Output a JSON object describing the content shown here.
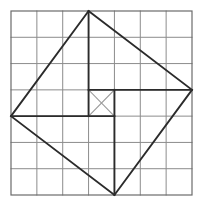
{
  "figure": {
    "background_color": "#ffffff",
    "canvas": {
      "width": 201,
      "height": 207
    },
    "grid": {
      "label": "square grid",
      "columns": 7,
      "rows": 7,
      "x_start": 11,
      "y_start": 11,
      "x_end": 192,
      "y_end": 195,
      "cell_width": 25.857,
      "cell_height": 26.286,
      "line_color": "#8c8c8c",
      "line_width": 1.0,
      "border_color": "#6b6b6b",
      "border_width": 1.2,
      "x_lines": [
        11,
        36.86,
        62.71,
        88.57,
        114.43,
        140.29,
        166.14,
        192
      ],
      "y_lines": [
        11,
        37.29,
        63.57,
        89.86,
        116.14,
        142.43,
        168.71,
        195
      ]
    },
    "tilted_square": {
      "label": "tilted square (diamond)",
      "stroke_color": "#2b2b2b",
      "stroke_width": 1.9,
      "vertices": [
        {
          "name": "top",
          "x": 88.57,
          "y": 11
        },
        {
          "name": "right",
          "x": 192,
          "y": 89.86
        },
        {
          "name": "bottom",
          "x": 114.43,
          "y": 195
        },
        {
          "name": "left",
          "x": 11,
          "y": 116.14
        }
      ]
    },
    "inner_lines": [
      {
        "name": "vertical-upper-segment",
        "x1": 88.57,
        "y1": 11,
        "x2": 88.57,
        "y2": 116.14,
        "stroke_color": "#2b2b2b",
        "stroke_width": 1.9
      },
      {
        "name": "vertical-lower-segment",
        "x1": 114.43,
        "y1": 89.86,
        "x2": 114.43,
        "y2": 195,
        "stroke_color": "#2b2b2b",
        "stroke_width": 1.9
      },
      {
        "name": "horizontal-left-segment",
        "x1": 11,
        "y1": 116.14,
        "x2": 114.43,
        "y2": 116.14,
        "stroke_color": "#2b2b2b",
        "stroke_width": 1.9
      },
      {
        "name": "horizontal-right-segment",
        "x1": 88.57,
        "y1": 89.86,
        "x2": 192,
        "y2": 89.86,
        "stroke_color": "#2b2b2b",
        "stroke_width": 1.9
      }
    ],
    "center_cell": {
      "label": "central unit square with diagonals",
      "x": 88.57,
      "y": 89.86,
      "width": 25.857,
      "height": 26.286,
      "diagonal_stroke_color": "#9a9a9a",
      "diagonal_stroke_width": 1.1,
      "diagonals": [
        {
          "name": "diagonal-nw-se",
          "x1": 88.57,
          "y1": 89.86,
          "x2": 114.43,
          "y2": 116.14
        },
        {
          "name": "diagonal-ne-sw",
          "x1": 114.43,
          "y1": 89.86,
          "x2": 88.57,
          "y2": 116.14
        }
      ]
    }
  }
}
